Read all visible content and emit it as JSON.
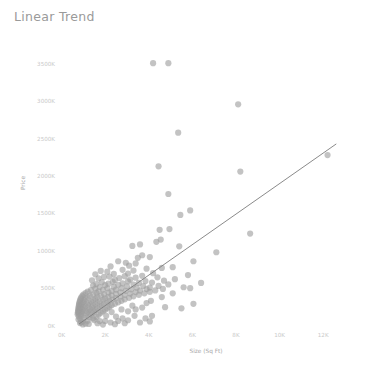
{
  "chart_title": "Linear Trend",
  "axis": {
    "y_title": "Price",
    "x_title": "Size (Sq Ft)",
    "y_ticks": [
      "0K",
      "500K",
      "1000K",
      "1500K",
      "2000K",
      "2500K",
      "3000K",
      "3500K"
    ],
    "x_ticks": [
      "0K",
      "2K",
      "4K",
      "6K",
      "8K",
      "10K",
      "12K"
    ]
  },
  "colors": {
    "title": "#9a9a9a",
    "tick": "#c9c9c9",
    "axis_title": "#a8a8a8",
    "point": "#9e9e9e",
    "trend_line": "#7d7d7d",
    "background": "#ffffff"
  },
  "chart_data": {
    "type": "scatter",
    "title": "Linear Trend",
    "xlabel": "Size (Sq Ft)",
    "ylabel": "Price",
    "xlim": [
      0,
      13000
    ],
    "ylim": [
      0,
      3700
    ],
    "xticks": [
      0,
      2000,
      4000,
      6000,
      8000,
      10000,
      12000
    ],
    "xticklabels": [
      "0K",
      "2K",
      "4K",
      "6K",
      "8K",
      "10K",
      "12K"
    ],
    "yticks": [
      0,
      500,
      1000,
      1500,
      2000,
      2500,
      3000,
      3500
    ],
    "yticklabels": [
      "0K",
      "500K",
      "1000K",
      "1500K",
      "2000K",
      "2500K",
      "3000K",
      "3500K"
    ],
    "grid": false,
    "legend": "none",
    "marker_size": 4,
    "marker_opacity": 0.62,
    "trend": {
      "type": "linear",
      "x_start": 800,
      "y_start": 20,
      "x_end": 12600,
      "y_end": 2430
    },
    "points": [
      [
        4200,
        3510
      ],
      [
        4900,
        3510
      ],
      [
        8100,
        2960
      ],
      [
        5350,
        2580
      ],
      [
        12200,
        2280
      ],
      [
        4450,
        2130
      ],
      [
        8200,
        2060
      ],
      [
        4900,
        1760
      ],
      [
        5900,
        1540
      ],
      [
        5450,
        1480
      ],
      [
        4950,
        1290
      ],
      [
        8650,
        1230
      ],
      [
        4500,
        1280
      ],
      [
        4550,
        1150
      ],
      [
        4350,
        1120
      ],
      [
        5400,
        1060
      ],
      [
        3600,
        1085
      ],
      [
        3250,
        1065
      ],
      [
        7100,
        980
      ],
      [
        3700,
        940
      ],
      [
        4050,
        915
      ],
      [
        3500,
        905
      ],
      [
        6050,
        860
      ],
      [
        2600,
        860
      ],
      [
        2950,
        840
      ],
      [
        3400,
        830
      ],
      [
        3100,
        800
      ],
      [
        2250,
        790
      ],
      [
        5100,
        780
      ],
      [
        4600,
        770
      ],
      [
        3900,
        760
      ],
      [
        2800,
        745
      ],
      [
        3300,
        735
      ],
      [
        1800,
        730
      ],
      [
        2100,
        720
      ],
      [
        4200,
        700
      ],
      [
        3050,
        695
      ],
      [
        2400,
        690
      ],
      [
        1550,
        685
      ],
      [
        5800,
        675
      ],
      [
        3700,
        665
      ],
      [
        2900,
        660
      ],
      [
        2200,
        655
      ],
      [
        1950,
        650
      ],
      [
        4400,
        645
      ],
      [
        3400,
        640
      ],
      [
        2650,
        635
      ],
      [
        1700,
        630
      ],
      [
        5200,
        620
      ],
      [
        3150,
        615
      ],
      [
        2450,
        610
      ],
      [
        1400,
        605
      ],
      [
        4700,
        600
      ],
      [
        3850,
        595
      ],
      [
        3050,
        590
      ],
      [
        2350,
        585
      ],
      [
        1850,
        580
      ],
      [
        4150,
        575
      ],
      [
        3550,
        570
      ],
      [
        2800,
        565
      ],
      [
        2150,
        560
      ],
      [
        1600,
        555
      ],
      [
        4900,
        550
      ],
      [
        3300,
        548
      ],
      [
        2600,
        545
      ],
      [
        2000,
        540
      ],
      [
        1450,
        535
      ],
      [
        4450,
        530
      ],
      [
        3750,
        528
      ],
      [
        3000,
        525
      ],
      [
        2400,
        520
      ],
      [
        1750,
        515
      ],
      [
        5600,
        512
      ],
      [
        4050,
        508
      ],
      [
        3450,
        505
      ],
      [
        2750,
        500
      ],
      [
        2100,
        498
      ],
      [
        1550,
        495
      ],
      [
        4650,
        490
      ],
      [
        3900,
        487
      ],
      [
        3200,
        484
      ],
      [
        2500,
        480
      ],
      [
        1900,
        477
      ],
      [
        1350,
        474
      ],
      [
        4300,
        470
      ],
      [
        3600,
        467
      ],
      [
        2950,
        464
      ],
      [
        2300,
        460
      ],
      [
        1700,
        457
      ],
      [
        1200,
        454
      ],
      [
        4050,
        450
      ],
      [
        3400,
        447
      ],
      [
        2700,
        444
      ],
      [
        2150,
        440
      ],
      [
        1600,
        437
      ],
      [
        1100,
        434
      ],
      [
        3800,
        430
      ],
      [
        3150,
        427
      ],
      [
        2500,
        424
      ],
      [
        1950,
        420
      ],
      [
        1450,
        417
      ],
      [
        1000,
        414
      ],
      [
        3550,
        410
      ],
      [
        2900,
        407
      ],
      [
        2300,
        404
      ],
      [
        1800,
        400
      ],
      [
        1300,
        397
      ],
      [
        950,
        394
      ],
      [
        3300,
        390
      ],
      [
        2700,
        387
      ],
      [
        2150,
        384
      ],
      [
        1650,
        380
      ],
      [
        1200,
        377
      ],
      [
        900,
        374
      ],
      [
        3100,
        370
      ],
      [
        2500,
        367
      ],
      [
        2000,
        364
      ],
      [
        1550,
        360
      ],
      [
        1100,
        357
      ],
      [
        870,
        354
      ],
      [
        2900,
        350
      ],
      [
        2350,
        347
      ],
      [
        1900,
        344
      ],
      [
        1450,
        340
      ],
      [
        1050,
        337
      ],
      [
        850,
        334
      ],
      [
        2750,
        330
      ],
      [
        2200,
        327
      ],
      [
        1750,
        324
      ],
      [
        1350,
        320
      ],
      [
        1000,
        317
      ],
      [
        830,
        314
      ],
      [
        2600,
        310
      ],
      [
        2100,
        307
      ],
      [
        1650,
        304
      ],
      [
        1250,
        300
      ],
      [
        950,
        297
      ],
      [
        810,
        294
      ],
      [
        2450,
        290
      ],
      [
        1950,
        287
      ],
      [
        1550,
        284
      ],
      [
        1200,
        280
      ],
      [
        920,
        277
      ],
      [
        800,
        274
      ],
      [
        2300,
        270
      ],
      [
        1850,
        267
      ],
      [
        1450,
        264
      ],
      [
        1100,
        260
      ],
      [
        880,
        257
      ],
      [
        790,
        254
      ],
      [
        2200,
        250
      ],
      [
        1750,
        247
      ],
      [
        1400,
        244
      ],
      [
        1050,
        240
      ],
      [
        860,
        237
      ],
      [
        780,
        234
      ],
      [
        2100,
        230
      ],
      [
        1650,
        227
      ],
      [
        1300,
        224
      ],
      [
        1000,
        220
      ],
      [
        840,
        217
      ],
      [
        770,
        214
      ],
      [
        2000,
        210
      ],
      [
        1550,
        207
      ],
      [
        1250,
        204
      ],
      [
        960,
        200
      ],
      [
        820,
        197
      ],
      [
        760,
        194
      ],
      [
        1900,
        190
      ],
      [
        1500,
        187
      ],
      [
        1200,
        184
      ],
      [
        930,
        180
      ],
      [
        810,
        177
      ],
      [
        750,
        174
      ],
      [
        1800,
        170
      ],
      [
        1420,
        167
      ],
      [
        1150,
        164
      ],
      [
        900,
        160
      ],
      [
        800,
        157
      ],
      [
        740,
        150
      ],
      [
        1700,
        145
      ],
      [
        1350,
        140
      ],
      [
        1080,
        135
      ],
      [
        880,
        128
      ],
      [
        790,
        120
      ],
      [
        1600,
        115
      ],
      [
        1280,
        108
      ],
      [
        1030,
        100
      ],
      [
        860,
        90
      ],
      [
        780,
        80
      ],
      [
        1500,
        72
      ],
      [
        1200,
        62
      ],
      [
        980,
        52
      ],
      [
        900,
        42
      ],
      [
        850,
        32
      ],
      [
        1100,
        25
      ],
      [
        3050,
        190
      ],
      [
        3400,
        215
      ],
      [
        3700,
        240
      ],
      [
        2500,
        120
      ],
      [
        2800,
        95
      ],
      [
        4100,
        330
      ],
      [
        4600,
        380
      ],
      [
        3900,
        300
      ],
      [
        5100,
        430
      ],
      [
        2300,
        180
      ],
      [
        2750,
        215
      ],
      [
        3250,
        265
      ],
      [
        2050,
        130
      ],
      [
        5900,
        500
      ],
      [
        6400,
        570
      ],
      [
        2000,
        60
      ],
      [
        4750,
        245
      ],
      [
        3350,
        130
      ],
      [
        2600,
        60
      ],
      [
        1450,
        95
      ],
      [
        1750,
        60
      ],
      [
        3050,
        70
      ],
      [
        4150,
        130
      ],
      [
        6050,
        290
      ],
      [
        5500,
        230
      ],
      [
        3850,
        95
      ],
      [
        2250,
        40
      ],
      [
        1650,
        30
      ],
      [
        1250,
        20
      ],
      [
        980,
        15
      ],
      [
        2900,
        30
      ],
      [
        3600,
        40
      ],
      [
        4050,
        55
      ],
      [
        2450,
        18
      ],
      [
        1900,
        12
      ]
    ]
  }
}
